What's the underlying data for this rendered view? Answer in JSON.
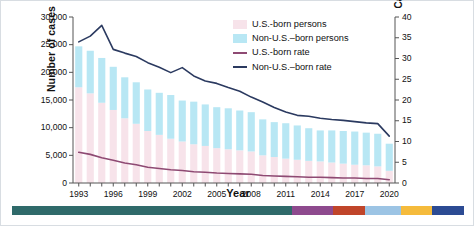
{
  "axes": {
    "left": {
      "title": "Number of cases",
      "ticks": [
        "0",
        "5,000",
        "10,000",
        "15,000",
        "20,000",
        "25,000",
        "30,000"
      ]
    },
    "right": {
      "title": "Cases per 100,000 persons",
      "ticks": [
        "0",
        "5",
        "10",
        "15",
        "20",
        "25",
        "30",
        "35",
        "40"
      ]
    },
    "x": {
      "title": "Year",
      "ticks": [
        "1993",
        "1996",
        "1999",
        "2002",
        "2005",
        "2008",
        "2011",
        "2014",
        "2017",
        "2020"
      ]
    }
  },
  "legend": {
    "items": [
      {
        "label": "U.S.-born persons",
        "type": "swatch",
        "color": "#f7e3ea"
      },
      {
        "label": "Non-U.S.–born persons",
        "type": "swatch",
        "color": "#b8e7f4"
      },
      {
        "label": "U.S.-born rate",
        "type": "line",
        "color": "#8e4a73"
      },
      {
        "label": "Non-U.S.–born rate",
        "type": "line",
        "color": "#2b3a60"
      }
    ]
  },
  "colors": {
    "us_born_bar": "#f7e3ea",
    "non_us_born_bar": "#b8e7f4",
    "us_born_rate_line": "#8e4a73",
    "non_us_born_rate_line": "#2b3a60",
    "axis": "#555555",
    "ribbon": [
      "#2f6a6a",
      "#8e4a8e",
      "#c0452a",
      "#9cc4e4",
      "#f5bb3c",
      "#2c4b93"
    ]
  },
  "chart_data": {
    "type": "bar",
    "title": "",
    "subtitle": "",
    "xlabel": "Year",
    "ylabel": "Number of cases",
    "y2label": "Cases per 100,000 persons",
    "ylim": [
      0,
      30000
    ],
    "y2lim": [
      0,
      40
    ],
    "grid": false,
    "legend_position": "top-right",
    "stacked": true,
    "categories": [
      "1993",
      "1994",
      "1995",
      "1996",
      "1997",
      "1998",
      "1999",
      "2000",
      "2001",
      "2002",
      "2003",
      "2004",
      "2005",
      "2006",
      "2007",
      "2008",
      "2009",
      "2010",
      "2011",
      "2012",
      "2013",
      "2014",
      "2015",
      "2016",
      "2017",
      "2018",
      "2019",
      "2020"
    ],
    "series": [
      {
        "name": "U.S.-born persons",
        "axis": "left",
        "kind": "bar",
        "color": "#f7e3ea",
        "values": [
          17300,
          16200,
          14500,
          13200,
          11700,
          10700,
          9400,
          8700,
          8000,
          7500,
          7000,
          6700,
          6300,
          6100,
          5900,
          5700,
          5000,
          4700,
          4400,
          4200,
          4000,
          3900,
          3700,
          3500,
          3300,
          3200,
          3000,
          2200
        ]
      },
      {
        "name": "Non-U.S.–born persons",
        "axis": "left",
        "kind": "bar",
        "color": "#b8e7f4",
        "values": [
          7400,
          7700,
          8100,
          7800,
          7400,
          7500,
          7500,
          7600,
          7900,
          7400,
          7700,
          7500,
          7400,
          7400,
          7200,
          7100,
          6500,
          6300,
          6400,
          6200,
          5900,
          5600,
          5800,
          5900,
          6000,
          5900,
          5900,
          4900
        ]
      },
      {
        "name": "U.S.-born rate",
        "axis": "right",
        "kind": "line",
        "color": "#8e4a73",
        "values": [
          7.4,
          6.9,
          6.1,
          5.5,
          4.8,
          4.4,
          3.8,
          3.5,
          3.2,
          3.0,
          2.7,
          2.6,
          2.4,
          2.3,
          2.2,
          2.1,
          1.8,
          1.7,
          1.6,
          1.5,
          1.4,
          1.4,
          1.3,
          1.2,
          1.2,
          1.1,
          1.1,
          0.8
        ]
      },
      {
        "name": "Non-U.S.–born rate",
        "axis": "right",
        "kind": "line",
        "color": "#2b3a60",
        "values": [
          34.0,
          35.4,
          38.0,
          32.2,
          31.3,
          30.5,
          29.0,
          27.9,
          26.6,
          27.8,
          25.8,
          24.6,
          24.0,
          23.0,
          22.1,
          20.7,
          19.5,
          18.2,
          17.1,
          16.3,
          16.1,
          15.6,
          15.3,
          15.1,
          14.8,
          14.5,
          14.3,
          11.3
        ]
      }
    ]
  }
}
